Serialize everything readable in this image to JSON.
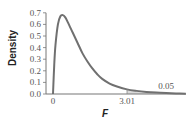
{
  "chart_data": {
    "type": "line",
    "title": "",
    "xlabel": "F",
    "ylabel": "Density",
    "ylim": [
      0.0,
      0.7
    ],
    "yticks": [
      "0.0",
      "0.1",
      "0.2",
      "0.3",
      "0.4",
      "0.5",
      "0.6",
      "0.7"
    ],
    "xticks": [
      "0",
      "3.01"
    ],
    "x_range": [
      0,
      5.4
    ],
    "grid": false,
    "series": [
      {
        "name": "F density",
        "x": [
          0.0,
          0.05,
          0.1,
          0.2,
          0.3,
          0.4,
          0.5,
          0.6,
          0.8,
          1.0,
          1.2,
          1.4,
          1.6,
          1.8,
          2.0,
          2.3,
          2.6,
          3.01,
          3.4,
          3.8,
          4.2,
          4.6,
          5.0,
          5.4
        ],
        "y": [
          0.0,
          0.25,
          0.42,
          0.6,
          0.67,
          0.68,
          0.66,
          0.62,
          0.53,
          0.44,
          0.35,
          0.28,
          0.22,
          0.17,
          0.13,
          0.09,
          0.065,
          0.04,
          0.027,
          0.018,
          0.012,
          0.008,
          0.005,
          0.003
        ]
      }
    ],
    "shaded_region": {
      "from": 3.01,
      "to": 5.4,
      "area_label": "0.05"
    },
    "annotations": [
      {
        "text": "0.05",
        "x": 4.6,
        "y": 0.07
      },
      {
        "text": "3.01",
        "x": 3.01,
        "position": "below-axis"
      }
    ],
    "colors": {
      "curve": "#707070",
      "shade": "#d9d9d9",
      "axis": "#777777"
    }
  },
  "labels": {
    "y_title": "Density",
    "x_title": "F",
    "tail_prob": "0.05",
    "critical_value": "3.01",
    "zero": "0",
    "top_cut": "0.05"
  }
}
